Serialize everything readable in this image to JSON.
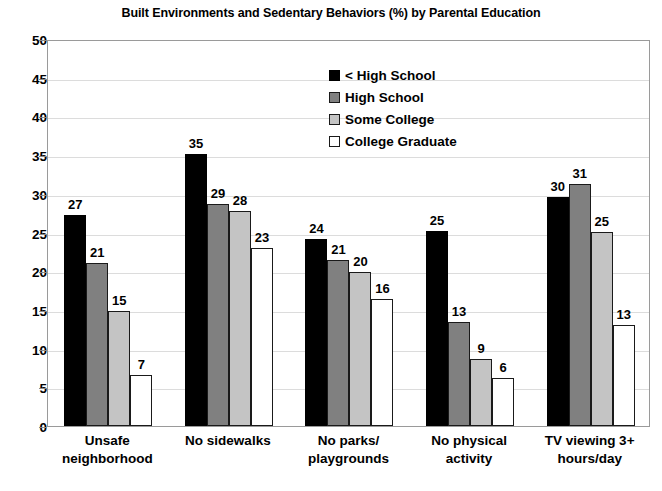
{
  "chart_data": {
    "type": "bar",
    "title": "Built Environments and Sedentary Behaviors (%) by Parental Education",
    "xlabel": "",
    "ylabel": "",
    "ylim": [
      0,
      50
    ],
    "ytick_step": 5,
    "yticks": [
      50,
      45,
      40,
      35,
      30,
      25,
      20,
      15,
      10,
      5,
      0
    ],
    "grid": true,
    "legend_position": "top-center",
    "categories": [
      "Unsafe neighborhood",
      "No sidewalks",
      "No parks/ playgrounds",
      "No physical activity",
      "TV viewing 3+ hours/day"
    ],
    "category_lines": [
      [
        "Unsafe",
        "neighborhood"
      ],
      [
        "No sidewalks"
      ],
      [
        "No parks/",
        "playgrounds"
      ],
      [
        "No physical",
        "activity"
      ],
      [
        "TV viewing 3+",
        "hours/day"
      ]
    ],
    "series": [
      {
        "name": "< High School",
        "color": "#000000",
        "values": [
          27,
          35,
          24,
          25,
          30
        ]
      },
      {
        "name": "High School",
        "color": "#808080",
        "values": [
          21,
          29,
          21,
          13,
          31
        ]
      },
      {
        "name": "Some College",
        "color": "#c4c4c4",
        "values": [
          15,
          28,
          20,
          9,
          25
        ]
      },
      {
        "name": "College Graduate",
        "color": "#ffffff",
        "values": [
          7,
          23,
          16,
          6,
          13
        ]
      }
    ],
    "bar_render_heights": [
      [
        27.3,
        35.1,
        24.1,
        25.2,
        29.6
      ],
      [
        21.0,
        28.7,
        21.4,
        13.4,
        31.3
      ],
      [
        14.8,
        27.8,
        19.9,
        8.6,
        25.1
      ],
      [
        6.6,
        23.0,
        16.4,
        6.2,
        13.0
      ]
    ]
  },
  "legend": {
    "items": [
      {
        "label": "< High School"
      },
      {
        "label": "High School"
      },
      {
        "label": "Some College"
      },
      {
        "label": "College Graduate"
      }
    ]
  }
}
